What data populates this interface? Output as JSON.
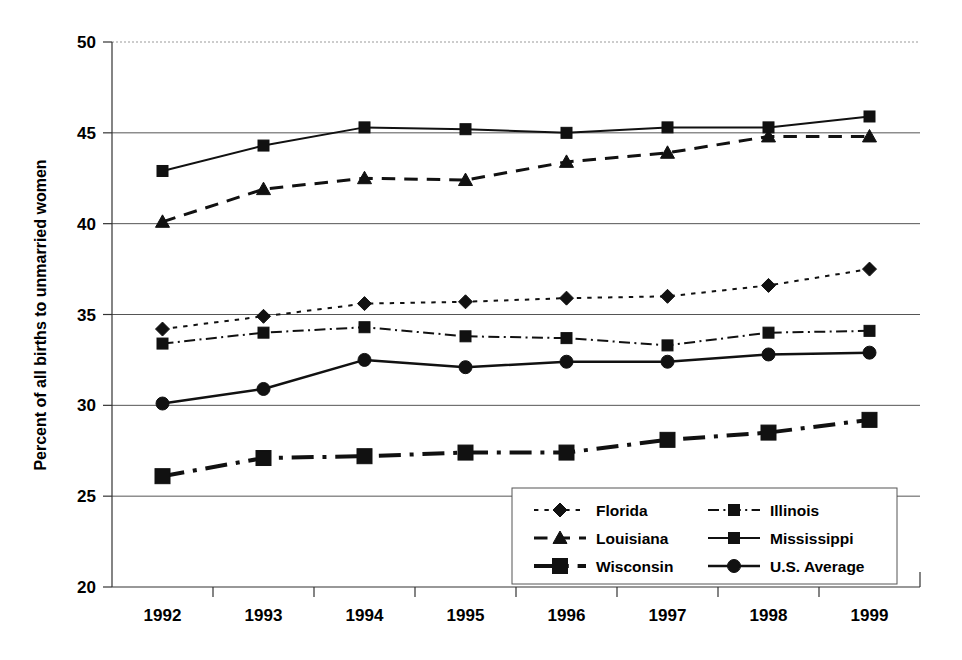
{
  "chart_data": {
    "type": "line",
    "title": "",
    "xlabel": "",
    "ylabel": "Percent of all births to unmarried women",
    "categories": [
      "1992",
      "1993",
      "1994",
      "1995",
      "1996",
      "1997",
      "1998",
      "1999"
    ],
    "ylim": [
      20,
      50
    ],
    "yticks": [
      20,
      25,
      30,
      35,
      40,
      45,
      50
    ],
    "ytick_labels": [
      "20",
      "25",
      "30",
      "35",
      "40",
      "45",
      "50"
    ],
    "grid": true,
    "legend_position": "bottom-right",
    "series": [
      {
        "name": "Florida",
        "values": [
          34.2,
          34.9,
          35.6,
          35.7,
          35.9,
          36.0,
          36.6,
          37.5
        ],
        "marker": "diamond",
        "line_style": "dotted",
        "line_width": 2,
        "color": "#111111"
      },
      {
        "name": "Illinois",
        "values": [
          33.4,
          34.0,
          34.3,
          33.8,
          33.7,
          33.3,
          34.0,
          34.1
        ],
        "marker": "square",
        "line_style": "dash-dot",
        "line_width": 2,
        "color": "#111111"
      },
      {
        "name": "Louisiana",
        "values": [
          40.1,
          41.9,
          42.5,
          42.4,
          43.4,
          43.9,
          44.8,
          44.8
        ],
        "marker": "triangle",
        "line_style": "dashed",
        "line_width": 3,
        "color": "#111111"
      },
      {
        "name": "Mississippi",
        "values": [
          42.9,
          44.3,
          45.3,
          45.2,
          45.0,
          45.3,
          45.3,
          45.9
        ],
        "marker": "square",
        "line_style": "solid",
        "line_width": 2,
        "color": "#111111"
      },
      {
        "name": "Wisconsin",
        "values": [
          26.1,
          27.1,
          27.2,
          27.4,
          27.4,
          28.1,
          28.5,
          29.2
        ],
        "marker": "square-large",
        "line_style": "dash-dot",
        "line_width": 4,
        "color": "#111111"
      },
      {
        "name": "U.S. Average",
        "values": [
          30.1,
          30.9,
          32.5,
          32.1,
          32.4,
          32.4,
          32.8,
          32.9
        ],
        "marker": "circle",
        "line_style": "solid",
        "line_width": 2.5,
        "color": "#111111"
      }
    ]
  },
  "legend": {
    "entries": [
      {
        "label": "Florida"
      },
      {
        "label": "Illinois"
      },
      {
        "label": "Louisiana"
      },
      {
        "label": "Mississippi"
      },
      {
        "label": "Wisconsin"
      },
      {
        "label": "U.S. Average"
      }
    ]
  },
  "colors": {
    "ink": "#111111",
    "gridline": "#555555",
    "background": "#ffffff"
  }
}
